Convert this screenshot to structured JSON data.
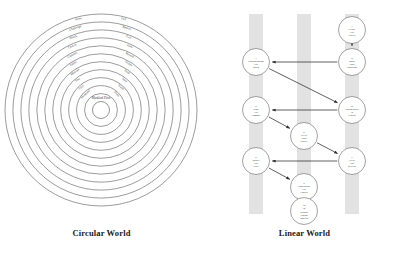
{
  "figure": {
    "panels": [
      {
        "id": "circular",
        "caption": "Circular World"
      },
      {
        "id": "linear",
        "caption": "Linear World"
      }
    ]
  },
  "circular_world": {
    "caption": "Circular World",
    "ring_count": 11,
    "core_label": "Mankind Plots",
    "rings": [
      {
        "index": 1,
        "left_label": "Arise",
        "right_label": "Fall"
      },
      {
        "index": 2,
        "left_label": "Challenge",
        "right_label": "Return"
      },
      {
        "index": 3,
        "left_label": "Block",
        "right_label": "Exit"
      },
      {
        "index": 4,
        "left_label": "Choice",
        "right_label": "Path"
      },
      {
        "index": 5,
        "left_label": "Commit",
        "right_label": "Reveal"
      },
      {
        "index": 6,
        "left_label": "Taken",
        "right_label": "Stolen"
      },
      {
        "index": 7,
        "left_label": "Mistake",
        "right_label": "Trial"
      },
      {
        "index": 8,
        "left_label": "Test",
        "right_label": "Turn"
      },
      {
        "index": 9,
        "left_label": "Trial",
        "right_label": "Truth"
      },
      {
        "index": 10,
        "left_label": "Mankind",
        "right_label": "Plots"
      }
    ]
  },
  "linear_world": {
    "caption": "Linear World",
    "lane_count": 3,
    "nodes": [
      {
        "num": "1",
        "lines": [
          "Create",
          "His",
          "Object"
        ],
        "lane": 3,
        "row": 1
      },
      {
        "num": "2",
        "lines": [
          "Make",
          "Hold",
          "Challenge"
        ],
        "lane": 3,
        "row": 2
      },
      {
        "num": "3",
        "lines": [
          "Understanding",
          "His",
          "Block"
        ],
        "lane": 1,
        "row": 2
      },
      {
        "num": "4",
        "lines": [
          "Losing Battle",
          "in",
          "Closed"
        ],
        "lane": 3,
        "row": 3
      },
      {
        "num": "5",
        "lines": [
          "Stop",
          "His",
          "Commit"
        ],
        "lane": 1,
        "row": 3
      },
      {
        "num": "6",
        "lines": [
          "Keep",
          "Hold",
          "Object"
        ],
        "lane": 2,
        "row": 4
      },
      {
        "num": "7",
        "lines": [
          "Every",
          "His",
          "Reveals"
        ],
        "lane": 3,
        "row": 5
      },
      {
        "num": "8",
        "lines": [
          "Sphere",
          "His",
          "Deal"
        ],
        "lane": 1,
        "row": 5
      },
      {
        "num": "9",
        "lines": [
          "Conclusion",
          "His",
          "Closed"
        ],
        "lane": 2,
        "row": 6
      },
      {
        "num": "10",
        "lines": [
          "To",
          "Regain",
          "Losing",
          "Inherits"
        ],
        "lane": 2,
        "row": 7
      }
    ],
    "edges": [
      {
        "from": "1",
        "to": "2",
        "style": "thin"
      },
      {
        "from": "2",
        "to": "3",
        "style": "thin"
      },
      {
        "from": "3",
        "to": "4",
        "style": "thin"
      },
      {
        "from": "4",
        "to": "5",
        "style": "thin"
      },
      {
        "from": "5",
        "to": "6",
        "style": "thin"
      },
      {
        "from": "6",
        "to": "7",
        "style": "thin"
      },
      {
        "from": "7",
        "to": "8",
        "style": "thin"
      },
      {
        "from": "8",
        "to": "9",
        "style": "thin"
      },
      {
        "from": "9",
        "to": "10",
        "style": "thick"
      }
    ]
  }
}
